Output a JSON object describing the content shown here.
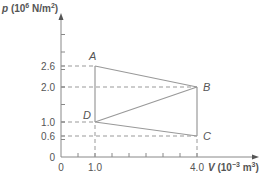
{
  "chart_data": {
    "type": "line",
    "title": "",
    "ylabel": "p (10^6 N/m^2)",
    "ylabel_parts": {
      "sym": "p",
      "pre": " (10",
      "sup": "6",
      "mid": " N/m",
      "sup2": "2",
      "post": ")"
    },
    "xlabel": "V (10^-3 m^3)",
    "xlabel_parts": {
      "sym": "V",
      "pre": " (10",
      "sup": "−3",
      "mid": " m",
      "sup2": "3",
      "post": ")"
    },
    "xlim": [
      0,
      5.8
    ],
    "ylim": [
      0,
      4.0
    ],
    "x_ticks": [
      "0",
      "1.0",
      "4.0"
    ],
    "y_ticks": [
      "0",
      "0.6",
      "1.0",
      "2.0",
      "2.6"
    ],
    "points": [
      {
        "label": "A",
        "V": 1.0,
        "p": 2.6
      },
      {
        "label": "B",
        "V": 4.0,
        "p": 2.0
      },
      {
        "label": "C",
        "V": 4.0,
        "p": 0.6
      },
      {
        "label": "D",
        "V": 1.0,
        "p": 1.0
      }
    ],
    "segments": [
      [
        "A",
        "B"
      ],
      [
        "B",
        "D"
      ],
      [
        "D",
        "C"
      ],
      [
        "C",
        "B"
      ],
      [
        "A",
        "D"
      ]
    ],
    "grid": false,
    "line_color": "#999999"
  }
}
